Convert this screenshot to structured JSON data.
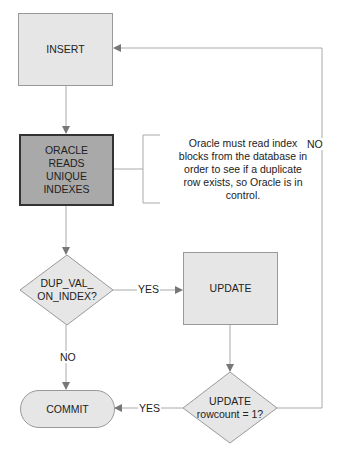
{
  "nodes": {
    "insert": "INSERT",
    "oracle_reads": [
      "ORACLE",
      "READS",
      "UNIQUE",
      "INDEXES"
    ],
    "dup_val": [
      "DUP_VAL_",
      "ON_INDEX?"
    ],
    "update": "UPDATE",
    "rowcount": [
      "UPDATE",
      "rowcount = 1?"
    ],
    "commit": "COMMIT"
  },
  "annotation": [
    "Oracle must read index",
    "blocks from the database in",
    "order to see if a duplicate",
    "row exists, so Oracle is in",
    "control."
  ],
  "edge_labels": {
    "dup_yes": "YES",
    "dup_no": "NO",
    "rowcount_yes": "YES",
    "rowcount_no": "NO"
  },
  "colors": {
    "node_fill": "#e6e6e6",
    "highlight_fill": "#a9a9a9",
    "line": "#999999"
  }
}
